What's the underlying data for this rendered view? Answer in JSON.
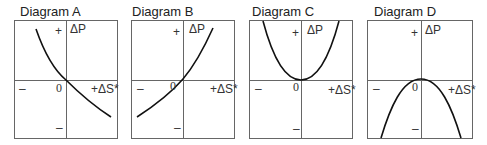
{
  "diagrams": [
    {
      "title": "Diagram A",
      "shape": "decreasing-curve",
      "y_label": "ΔP",
      "x_label": "+ΔS*",
      "plus": "+",
      "minus_left": "–",
      "minus_bottom": "–",
      "origin": "0"
    },
    {
      "title": "Diagram B",
      "shape": "increasing-curve",
      "y_label": "ΔP",
      "x_label": "+ΔS*",
      "plus": "+",
      "minus_left": "–",
      "minus_bottom": "–",
      "origin": "0"
    },
    {
      "title": "Diagram C",
      "shape": "u-shaped-parabola",
      "y_label": "ΔP",
      "x_label": "+ΔS*",
      "plus": "+",
      "minus_left": "–",
      "minus_bottom": "–",
      "origin": "0"
    },
    {
      "title": "Diagram D",
      "shape": "inverted-u-parabola",
      "y_label": "ΔP",
      "x_label": "+ΔS*",
      "plus": "+",
      "minus_left": "–",
      "minus_bottom": "–",
      "origin": "0"
    }
  ],
  "colors": {
    "frame": "#666666",
    "curve": "#111111",
    "text": "#222222"
  }
}
